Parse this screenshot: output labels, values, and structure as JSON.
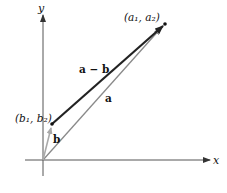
{
  "diagram": {
    "title": "",
    "axes": {
      "x_label": "x",
      "y_label": "y",
      "origin": [
        43,
        160
      ]
    },
    "points": {
      "a_tip": {
        "label": "(a₁, a₂)",
        "coords": [
          165,
          24
        ]
      },
      "b_tip": {
        "label": "(b₁, b₂)",
        "coords": [
          52,
          124
        ]
      }
    },
    "vectors": [
      {
        "name": "a",
        "label": "a",
        "from": "origin",
        "to": "a_tip",
        "color": "#8a8a8a"
      },
      {
        "name": "b",
        "label": "b",
        "from": "origin",
        "to": "b_tip",
        "color": "#a9a9a9"
      },
      {
        "name": "a-minus-b",
        "label": "a − b",
        "from": "b_tip",
        "to": "a_tip",
        "color": "#222222"
      }
    ],
    "colors": {
      "axis": "#555555",
      "vector_a": "#8a8a8a",
      "vector_b": "#a9a9a9",
      "vector_diff": "#222222"
    }
  }
}
